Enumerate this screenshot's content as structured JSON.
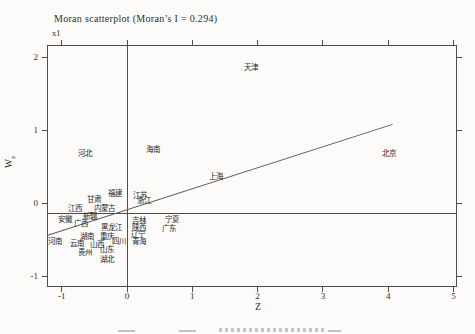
{
  "title": "Moran scatterplot (Moran’s I = 0.294)",
  "scale_note": "x1",
  "axes": {
    "x_label": "Z",
    "y_label_main": "W",
    "y_label_sub": "z",
    "x_ticks": [
      "-1",
      "0",
      "1",
      "2",
      "3",
      "4",
      "5"
    ],
    "y_ticks": [
      "2",
      "1",
      "0",
      "-1"
    ]
  },
  "colors": {
    "background": "#fcfbf9",
    "frame_line": "#4d4d4d",
    "regression_line": "#5a5a5a",
    "text": "#2e2e2e"
  },
  "chart_data": {
    "type": "scatter",
    "morans_i": 0.294,
    "xlabel": "Z",
    "ylabel": "Wz",
    "xlim": [
      -1.25,
      5.05
    ],
    "ylim": [
      -1.15,
      2.15
    ],
    "grid": false,
    "point_style": "text-labels-only",
    "mean_lines": {
      "x": 0,
      "y": -0.15
    },
    "regression_line": {
      "x1": -1.225,
      "y1": -0.44,
      "x2": 4.06,
      "y2": 1.08,
      "slope": 0.294
    },
    "points": [
      {
        "label": "天津",
        "x": 1.9,
        "y": 1.85
      },
      {
        "label": "河北",
        "x": -0.64,
        "y": 0.67
      },
      {
        "label": "海南",
        "x": 0.4,
        "y": 0.73
      },
      {
        "label": "上海",
        "x": 1.36,
        "y": 0.36
      },
      {
        "label": "北京",
        "x": 4.01,
        "y": 0.67
      },
      {
        "label": "福建",
        "x": -0.18,
        "y": 0.12
      },
      {
        "label": "江苏",
        "x": 0.2,
        "y": 0.1
      },
      {
        "label": "浙江",
        "x": 0.26,
        "y": 0.03
      },
      {
        "label": "甘肃",
        "x": -0.51,
        "y": 0.04
      },
      {
        "label": "江西",
        "x": -0.8,
        "y": -0.08
      },
      {
        "label": "内蒙古",
        "x": -0.35,
        "y": -0.08
      },
      {
        "label": "新疆",
        "x": -0.57,
        "y": -0.19
      },
      {
        "label": "安徽",
        "x": -0.95,
        "y": -0.23
      },
      {
        "label": "广西",
        "x": -0.7,
        "y": -0.29
      },
      {
        "label": "黑龙江",
        "x": -0.23,
        "y": -0.34
      },
      {
        "label": "吉林",
        "x": 0.18,
        "y": -0.25
      },
      {
        "label": "陕西",
        "x": 0.18,
        "y": -0.34
      },
      {
        "label": "宁夏",
        "x": 0.69,
        "y": -0.23
      },
      {
        "label": "广东",
        "x": 0.64,
        "y": -0.36
      },
      {
        "label": "辽宁",
        "x": 0.17,
        "y": -0.44
      },
      {
        "label": "湖南",
        "x": -0.61,
        "y": -0.47
      },
      {
        "label": "重庆",
        "x": -0.31,
        "y": -0.47
      },
      {
        "label": "四川",
        "x": -0.12,
        "y": -0.53
      },
      {
        "label": "青海",
        "x": 0.18,
        "y": -0.53
      },
      {
        "label": "河南",
        "x": -1.1,
        "y": -0.53
      },
      {
        "label": "云南",
        "x": -0.77,
        "y": -0.56
      },
      {
        "label": "山西",
        "x": -0.46,
        "y": -0.58
      },
      {
        "label": "贵州",
        "x": -0.64,
        "y": -0.68
      },
      {
        "label": "山东",
        "x": -0.31,
        "y": -0.64
      },
      {
        "label": "湖北",
        "x": -0.31,
        "y": -0.78
      }
    ]
  }
}
